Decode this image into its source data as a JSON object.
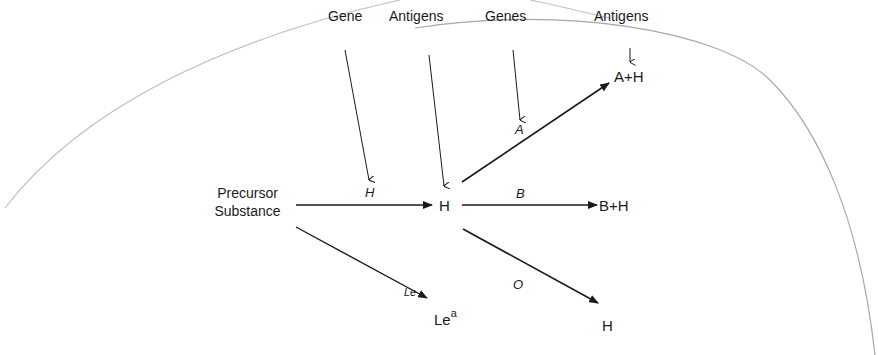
{
  "header_labels": {
    "gene": "Gene",
    "antigens_left": "Antigens",
    "genes": "Genes",
    "antigens_right": "Antigens"
  },
  "nodes": {
    "precursor_line1": "Precursor",
    "precursor_line2": "Substance",
    "h_center": "H",
    "a_plus_h": "A+H",
    "b_plus_h": "B+H",
    "h_bottom": "H",
    "le_base": "Le",
    "le_sup": "a"
  },
  "edge_labels": {
    "h_gene": "H",
    "a_gene": "A",
    "b_gene": "B",
    "o_gene": "O",
    "le_gene": "Le"
  },
  "colors": {
    "line": "#1a1a1a",
    "curve": "#b8b8b8"
  }
}
